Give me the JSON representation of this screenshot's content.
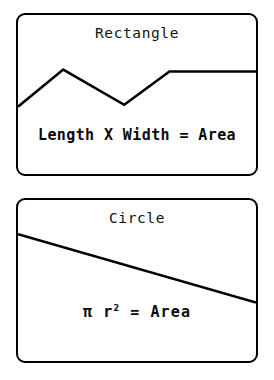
{
  "page": {
    "background_color": "#ffffff",
    "ink_color": "#000000",
    "width": 274,
    "height": 380
  },
  "cards": [
    {
      "id": "rectangle",
      "title": "Rectangle",
      "formula_prefix": "Length X Width = Area",
      "formula_base": "",
      "formula_exponent": "",
      "formula_suffix": ""
    },
    {
      "id": "circle",
      "title": "Circle",
      "formula_prefix": "π r",
      "formula_base": "",
      "formula_exponent": "2",
      "formula_suffix": " =  Area"
    }
  ],
  "chart_data": [
    {
      "type": "line",
      "title": "Rectangle",
      "xlabel": "",
      "ylabel": "",
      "annotations": [
        "Length X Width = Area"
      ],
      "grid": false,
      "legend": "none",
      "xlim": [
        0,
        242
      ],
      "ylim": [
        0,
        163
      ],
      "series": [
        {
          "name": "rectangle-polyline",
          "points": [
            [
              0,
              94
            ],
            [
              46,
              56
            ],
            [
              108,
              92
            ],
            [
              154,
              58
            ],
            [
              242,
              58
            ]
          ]
        }
      ]
    },
    {
      "type": "line",
      "title": "Circle",
      "xlabel": "",
      "ylabel": "",
      "annotations": [
        "π r² =  Area"
      ],
      "grid": false,
      "legend": "none",
      "xlim": [
        0,
        242
      ],
      "ylim": [
        0,
        165
      ],
      "series": [
        {
          "name": "circle-trendline",
          "points": [
            [
              0,
              35
            ],
            [
              242,
              105
            ]
          ]
        }
      ]
    }
  ]
}
